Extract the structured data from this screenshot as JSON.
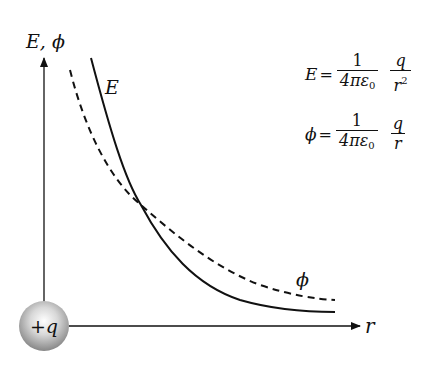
{
  "diagram": {
    "y_axis_label": "E, ϕ",
    "x_axis_label": "r",
    "charge_label": "+q",
    "curves": [
      {
        "name": "E",
        "label": "E",
        "style": "solid",
        "relation": "1/r^2"
      },
      {
        "name": "phi",
        "label": "ϕ",
        "style": "dashed",
        "relation": "1/r"
      }
    ],
    "formulas": {
      "field": {
        "lhs": "E",
        "eq": "=",
        "frac1_num": "1",
        "frac1_den": "4πε",
        "frac1_den_sub": "0",
        "frac2_num": "q",
        "frac2_den": "r",
        "frac2_den_sup": "2"
      },
      "potential": {
        "lhs": "ϕ",
        "eq": "=",
        "frac1_num": "1",
        "frac1_den": "4πε",
        "frac1_den_sub": "0",
        "frac2_num": "q",
        "frac2_den": "r",
        "frac2_den_sup": ""
      }
    },
    "colors": {
      "ink": "#111111",
      "background": "#ffffff"
    }
  }
}
